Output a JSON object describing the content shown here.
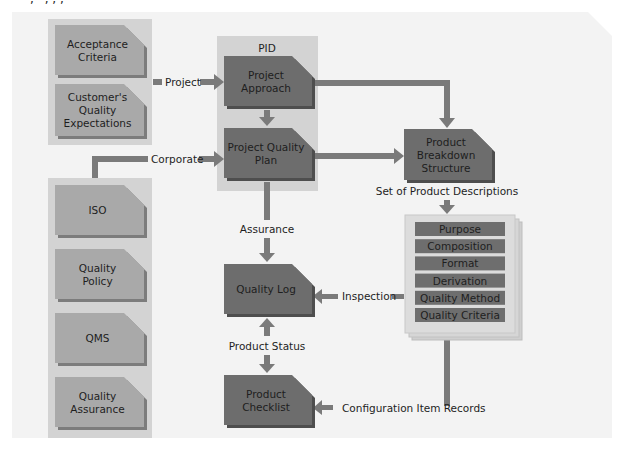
{
  "header_fragment": ", ' ,  ,  ,",
  "colors": {
    "panel": "#f3f3f3",
    "group_bg": "#d3d3d3",
    "light_doc": "#a9a9a9",
    "light_doc_shadow": "#7c7c7c",
    "dark_doc": "#6d6d6d",
    "dark_doc_shadow": "#4e4e4e",
    "arrow": "#7a7a7a",
    "stack_bg": "#d9d9d9",
    "item_bg": "#6e6e6e"
  },
  "left_top_group": {
    "docs": [
      {
        "lines": [
          "Acceptance",
          "Criteria"
        ]
      },
      {
        "lines": [
          "Customer's",
          "Quality",
          "Expectations"
        ]
      }
    ]
  },
  "left_bottom_group": {
    "docs": [
      {
        "lines": [
          "ISO"
        ]
      },
      {
        "lines": [
          "Quality",
          "Policy"
        ]
      },
      {
        "lines": [
          "QMS"
        ]
      },
      {
        "lines": [
          "Quality",
          "Assurance"
        ]
      }
    ]
  },
  "pid_group": {
    "title": "PID",
    "docs": [
      {
        "lines": [
          "Project",
          "Approach"
        ]
      },
      {
        "lines": [
          "Project Quality",
          "Plan"
        ]
      }
    ]
  },
  "product_breakdown": {
    "lines": [
      "Product",
      "Breakdown",
      "Structure"
    ]
  },
  "quality_log": {
    "lines": [
      "Quality Log"
    ]
  },
  "product_checklist": {
    "lines": [
      "Product",
      "Checklist"
    ]
  },
  "product_descriptions": {
    "label": "Set of Product Descriptions",
    "items": [
      "Purpose",
      "Composition",
      "Format",
      "Derivation",
      "Quality Method",
      "Quality Criteria"
    ]
  },
  "connectors": {
    "project": "Project",
    "corporate": "Corporate",
    "assurance": "Assurance",
    "inspection": "Inspection",
    "product_status": "Product Status",
    "configuration_item_records": "Configuration Item Records"
  }
}
